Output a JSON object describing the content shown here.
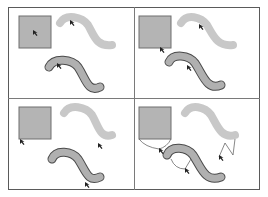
{
  "diagram": {
    "title": "",
    "layout": "2x2 grid of panels",
    "colors": {
      "frame": "#5a5a5a",
      "divider": "#7a7a7a",
      "square_fill": "#b4b4b4",
      "square_stroke": "#6e6e6e",
      "curve_light_fill": "#c8c8c8",
      "curve_dark_fill": "#b0b0b0",
      "curve_dark_stroke": "#4a4a4a",
      "cursor": "#222222",
      "connector": "#555555"
    },
    "panels": [
      {
        "id": "top-left",
        "shapes": [
          "square",
          "light-s-curve",
          "outlined-s-curve"
        ],
        "cursors": [
          "square-center",
          "light-curve-head",
          "outlined-curve-head"
        ]
      },
      {
        "id": "top-right",
        "shapes": [
          "square",
          "light-s-curve",
          "outlined-s-curve"
        ],
        "cursors": [
          "square-bottom",
          "light-curve-head",
          "outlined-curve-head"
        ]
      },
      {
        "id": "bottom-left",
        "shapes": [
          "square",
          "light-s-curve",
          "outlined-s-curve"
        ],
        "cursors": [
          "square-bottom-left",
          "light-curve-tail",
          "outlined-curve-tail"
        ]
      },
      {
        "id": "bottom-right",
        "shapes": [
          "square",
          "light-s-curve",
          "outlined-s-curve"
        ],
        "cursors": [
          "square-bottom-connector",
          "light-curve-tail-connector",
          "outlined-curve-mid-connector"
        ]
      }
    ]
  }
}
